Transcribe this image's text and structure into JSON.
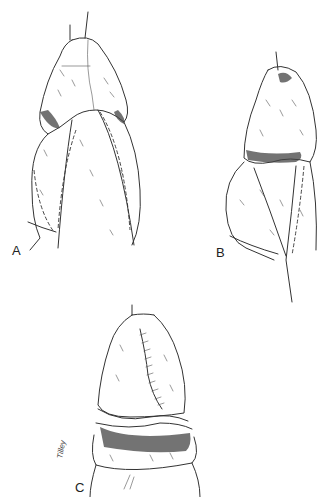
{
  "figure": {
    "panels": [
      {
        "id": "A",
        "label": "A",
        "description": "Frontal view with dashed incision lines along shaft"
      },
      {
        "id": "B",
        "label": "B",
        "description": "Lateral view with dashed incision line"
      },
      {
        "id": "C",
        "label": "C",
        "description": "Sutured closure, final result"
      }
    ],
    "signature": "Tilley"
  },
  "colors": {
    "ink": "#333333",
    "background": "#ffffff"
  }
}
